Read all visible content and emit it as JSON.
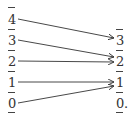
{
  "diagram": {
    "left_column": {
      "labels": [
        "4",
        "3",
        "2",
        "1",
        "0"
      ]
    },
    "right_column": {
      "labels": [
        "3",
        "2",
        "1",
        "0"
      ],
      "trailing_punctuation": "."
    },
    "mappings": [
      {
        "from": "4",
        "to": "3"
      },
      {
        "from": "3",
        "to": "2"
      },
      {
        "from": "2",
        "to": "2"
      },
      {
        "from": "1",
        "to": "1"
      },
      {
        "from": "0",
        "to": "1"
      }
    ]
  }
}
